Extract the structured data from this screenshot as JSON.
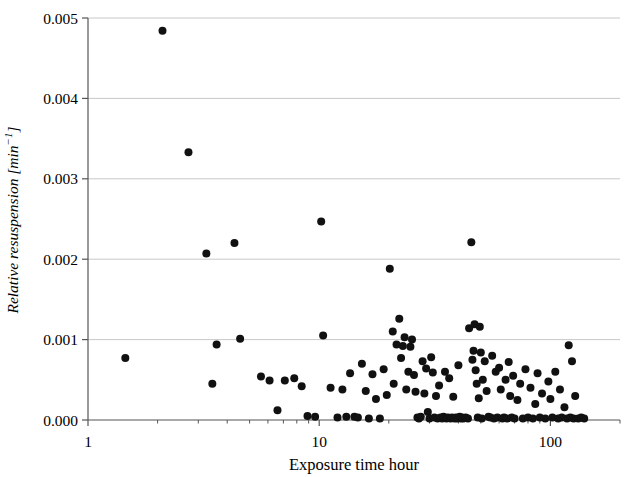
{
  "chart_data": {
    "type": "scatter",
    "title": "",
    "xlabel": "Exposure time hour",
    "ylabel": "Relative resuspension [min−1]",
    "ylabel_plain": "Relative resuspension [min-1]",
    "xscale": "log",
    "yscale": "linear",
    "xlim": [
      1,
      200
    ],
    "ylim": [
      0.0,
      0.005
    ],
    "grid": "horizontal-major",
    "legend": "none",
    "xticks": [
      1,
      10,
      100
    ],
    "xtick_labels": [
      "1",
      "10",
      "100"
    ],
    "xminor_ticks": [
      2,
      3,
      4,
      5,
      6,
      7,
      8,
      9,
      20,
      30,
      40,
      50,
      60,
      70,
      80,
      90,
      200
    ],
    "yticks": [
      0.0,
      0.001,
      0.002,
      0.003,
      0.004,
      0.005
    ],
    "ytick_labels": [
      "0.000",
      "0.001",
      "0.002",
      "0.003",
      "0.004",
      "0.005"
    ],
    "marker": "filled-circle",
    "marker_color": "#111111",
    "marker_size_px": 8,
    "n_points": 143,
    "points": [
      [
        1.45,
        0.00077
      ],
      [
        2.1,
        0.00484
      ],
      [
        2.72,
        0.00333
      ],
      [
        3.25,
        0.00207
      ],
      [
        3.45,
        0.00045
      ],
      [
        3.6,
        0.00094
      ],
      [
        4.3,
        0.0022
      ],
      [
        4.55,
        0.00101
      ],
      [
        5.6,
        0.00054
      ],
      [
        6.1,
        0.00049
      ],
      [
        6.6,
        0.00012
      ],
      [
        7.1,
        0.00049
      ],
      [
        7.8,
        0.00052
      ],
      [
        8.4,
        0.00042
      ],
      [
        8.9,
        5e-05
      ],
      [
        9.6,
        4e-05
      ],
      [
        10.2,
        0.00247
      ],
      [
        10.4,
        0.00105
      ],
      [
        11.2,
        0.0004
      ],
      [
        12.0,
        3e-05
      ],
      [
        12.6,
        0.00038
      ],
      [
        13.1,
        4e-05
      ],
      [
        13.6,
        0.00058
      ],
      [
        14.2,
        4e-05
      ],
      [
        14.7,
        3e-05
      ],
      [
        15.3,
        0.0007
      ],
      [
        15.9,
        0.00036
      ],
      [
        16.4,
        2e-05
      ],
      [
        17.0,
        0.00057
      ],
      [
        17.6,
        0.00026
      ],
      [
        18.3,
        2e-05
      ],
      [
        19.0,
        0.00063
      ],
      [
        19.6,
        0.00031
      ],
      [
        20.2,
        0.00188
      ],
      [
        20.8,
        0.0011
      ],
      [
        21.0,
        0.00045
      ],
      [
        21.6,
        0.00094
      ],
      [
        22.2,
        0.00126
      ],
      [
        22.6,
        0.00077
      ],
      [
        23.0,
        0.00092
      ],
      [
        23.4,
        0.00103
      ],
      [
        23.8,
        0.00038
      ],
      [
        24.3,
        0.0006
      ],
      [
        24.8,
        0.00091
      ],
      [
        25.2,
        0.001
      ],
      [
        25.7,
        0.00056
      ],
      [
        26.1,
        0.00035
      ],
      [
        26.6,
        3e-05
      ],
      [
        27.0,
        2e-05
      ],
      [
        27.5,
        4e-05
      ],
      [
        28.0,
        0.00073
      ],
      [
        28.5,
        0.00033
      ],
      [
        29.0,
        0.00064
      ],
      [
        29.5,
        0.0001
      ],
      [
        30.0,
        2e-05
      ],
      [
        30.5,
        0.00078
      ],
      [
        31.0,
        0.00059
      ],
      [
        31.5,
        3e-05
      ],
      [
        32.0,
        0.0003
      ],
      [
        32.5,
        2e-05
      ],
      [
        33.0,
        0.00043
      ],
      [
        33.5,
        3e-05
      ],
      [
        34.0,
        2e-05
      ],
      [
        34.5,
        4e-05
      ],
      [
        35.0,
        0.0006
      ],
      [
        35.5,
        2e-05
      ],
      [
        36.0,
        3e-05
      ],
      [
        36.5,
        0.00052
      ],
      [
        37.0,
        2e-05
      ],
      [
        37.5,
        3e-05
      ],
      [
        38.0,
        0.00029
      ],
      [
        38.5,
        2e-05
      ],
      [
        39.0,
        3e-05
      ],
      [
        39.5,
        2e-05
      ],
      [
        40.0,
        0.00068
      ],
      [
        40.5,
        4e-05
      ],
      [
        41.0,
        2e-05
      ],
      [
        41.5,
        3e-05
      ],
      [
        42.0,
        2e-05
      ],
      [
        43.0,
        3e-05
      ],
      [
        44.0,
        2e-05
      ],
      [
        44.5,
        0.00114
      ],
      [
        45.5,
        0.00221
      ],
      [
        46.0,
        0.00075
      ],
      [
        46.5,
        0.00086
      ],
      [
        47.0,
        0.00119
      ],
      [
        47.5,
        0.00062
      ],
      [
        48.0,
        0.00045
      ],
      [
        48.5,
        3e-05
      ],
      [
        49.0,
        0.00027
      ],
      [
        49.5,
        0.00116
      ],
      [
        50.0,
        0.00084
      ],
      [
        50.5,
        2e-05
      ],
      [
        51.0,
        0.0005
      ],
      [
        52.0,
        0.00073
      ],
      [
        53.0,
        0.00036
      ],
      [
        54.0,
        4e-05
      ],
      [
        55.0,
        3e-05
      ],
      [
        56.0,
        0.0008
      ],
      [
        57.0,
        2e-05
      ],
      [
        58.0,
        0.0006
      ],
      [
        59.0,
        3e-05
      ],
      [
        60.0,
        0.00065
      ],
      [
        61.0,
        0.00038
      ],
      [
        62.0,
        2e-05
      ],
      [
        63.0,
        3e-05
      ],
      [
        64.0,
        0.0005
      ],
      [
        65.0,
        2e-05
      ],
      [
        66.0,
        0.00072
      ],
      [
        67.0,
        0.0003
      ],
      [
        68.0,
        3e-05
      ],
      [
        69.0,
        0.00055
      ],
      [
        70.0,
        2e-05
      ],
      [
        72.0,
        0.00025
      ],
      [
        74.0,
        0.00045
      ],
      [
        76.0,
        2e-05
      ],
      [
        78.0,
        0.00063
      ],
      [
        80.0,
        3e-05
      ],
      [
        82.0,
        0.0004
      ],
      [
        84.0,
        2e-05
      ],
      [
        86.0,
        0.0002
      ],
      [
        88.0,
        0.00058
      ],
      [
        90.0,
        3e-05
      ],
      [
        92.0,
        0.00033
      ],
      [
        95.0,
        2e-05
      ],
      [
        98.0,
        0.00048
      ],
      [
        100.0,
        0.00026
      ],
      [
        102.0,
        3e-05
      ],
      [
        105.0,
        0.0006
      ],
      [
        108.0,
        2e-05
      ],
      [
        110.0,
        0.00038
      ],
      [
        112.0,
        3e-05
      ],
      [
        115.0,
        0.00016
      ],
      [
        118.0,
        2e-05
      ],
      [
        120.0,
        0.00093
      ],
      [
        122.0,
        3e-05
      ],
      [
        124.0,
        0.00073
      ],
      [
        126.0,
        2e-05
      ],
      [
        128.0,
        0.0003
      ],
      [
        132.0,
        2e-05
      ],
      [
        136.0,
        3e-05
      ],
      [
        140.0,
        2e-05
      ]
    ]
  },
  "axes": {
    "plot_left_px": 88,
    "plot_right_px": 620,
    "plot_top_px": 18,
    "plot_bottom_px": 420,
    "frame_color": "#555555",
    "grid_color": "#c8c8c8",
    "background": "#ffffff"
  }
}
